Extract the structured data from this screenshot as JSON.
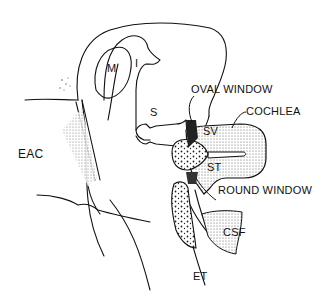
{
  "figure": {
    "type": "anatomical line drawing",
    "labels": {
      "eac": "EAC",
      "malleus": "M",
      "incus": "I",
      "stapes": "S",
      "oval_window": "OVAL WINDOW",
      "cochlea": "COCHLEA",
      "scala_vestibuli": "SV",
      "scala_tympani": "ST",
      "round_window": "ROUND WINDOW",
      "csf": "CSF",
      "eustachian_tube": "ET"
    },
    "colors": {
      "ink": "#111111",
      "stipple": "#555555",
      "background": "#ffffff"
    }
  }
}
